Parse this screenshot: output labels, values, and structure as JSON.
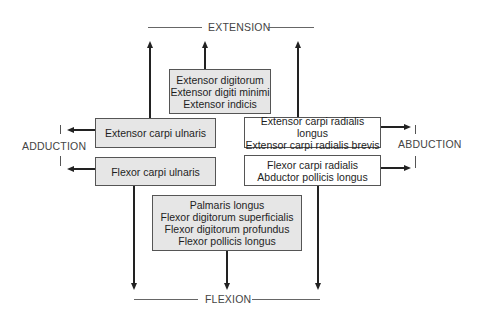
{
  "labels": {
    "top": "EXTENSION",
    "bottom": "FLEXION",
    "left": "ADDUCTION",
    "right": "ABDUCTION"
  },
  "boxes": {
    "top_center": {
      "fill": "gray",
      "lines": [
        "Extensor digitorum",
        "Extensor digiti minimi",
        "Extensor indicis"
      ]
    },
    "left_upper": {
      "fill": "gray",
      "lines": [
        "Extensor carpi ulnaris"
      ]
    },
    "left_lower": {
      "fill": "gray",
      "lines": [
        "Flexor carpi ulnaris"
      ]
    },
    "right_upper": {
      "fill": "white",
      "lines": [
        "Extensor carpi radialis longus",
        "Extensor carpi radialis brevis"
      ]
    },
    "right_lower": {
      "fill": "white",
      "lines": [
        "Flexor carpi radialis",
        "Abductor pollicis longus"
      ]
    },
    "bottom_center": {
      "fill": "gray",
      "lines": [
        "Palmaris longus",
        "Flexor digitorum superficialis",
        "Flexor digitorum profundus",
        "Flexor pollicis longus"
      ]
    }
  },
  "colors": {
    "gray_fill": "#e6e6e6",
    "white_fill": "#ffffff",
    "line": "#222222",
    "text": "#1e1e1e"
  }
}
